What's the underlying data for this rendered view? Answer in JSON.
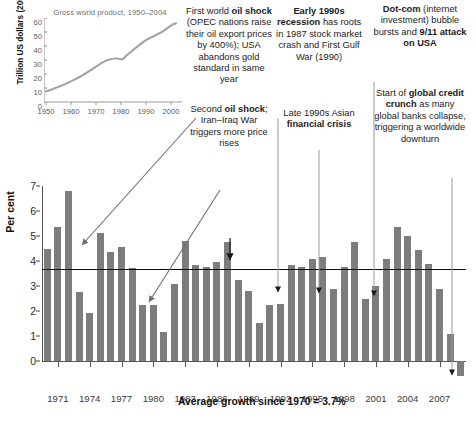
{
  "inset": {
    "title": "Gross world product, 1950–2004",
    "ylabel": "Trillion US dollars (2004 dollars)",
    "yticks": [
      "0",
      "10",
      "20",
      "30",
      "40",
      "50",
      "60"
    ],
    "xticks": [
      "1950",
      "1960",
      "1970",
      "1980",
      "1990",
      "2000"
    ]
  },
  "annotations": {
    "oil_shock_1": {
      "lines": [
        {
          "text": "First world ",
          "bold": false
        },
        {
          "text": "oil",
          "bold": true
        },
        {
          "text": " ",
          "bold": false
        },
        {
          "text": "shock",
          "bold": true
        },
        {
          "text": " (OPEC nations raise their oil export prices by 400%); USA abandons gold standard in same year",
          "bold": false
        }
      ],
      "plain": "First world oil shock (OPEC nations raise their oil export prices by 400%); USA abandons gold standard in same year"
    },
    "oil_shock_2": {
      "plain": "Second oil shock; Iran–Iraq War triggers more price rises"
    },
    "recession_1990s": {
      "plain": "Early 1990s recession has roots in 1987 stock market crash and First Gulf War (1990)"
    },
    "asian_crisis": {
      "plain": "Late 1990s Asian financial crisis"
    },
    "dotcom": {
      "plain": "Dot-com (internet investment) bubble bursts and 9/11 attack on USA"
    },
    "credit_crunch": {
      "plain": "Start of global credit crunch as many global banks collapse, triggering a worldwide downturn"
    }
  },
  "average_label": "Average growth since 1970 = 3.7%",
  "chart_data": {
    "type": "bar",
    "title": "",
    "xlabel": "",
    "ylabel": "Per cent",
    "ylim": [
      -1,
      7
    ],
    "yticks": [
      0,
      1,
      2,
      3,
      4,
      5,
      6,
      7
    ],
    "grid": false,
    "legend": "none",
    "average_line": 3.7,
    "categories": [
      1970,
      1971,
      1972,
      1973,
      1974,
      1975,
      1976,
      1977,
      1978,
      1979,
      1980,
      1981,
      1982,
      1983,
      1984,
      1985,
      1986,
      1987,
      1988,
      1989,
      1990,
      1991,
      1992,
      1993,
      1994,
      1995,
      1996,
      1997,
      1998,
      1999,
      2000,
      2001,
      2002,
      2003,
      2004,
      2005,
      2006,
      2007,
      2008,
      2009
    ],
    "xtick_labels": [
      "1971",
      "1974",
      "1977",
      "1980",
      "1983",
      "1986",
      "1989",
      "1992",
      "1995",
      "1998",
      "2001",
      "2004",
      "2007"
    ],
    "values": [
      4.47,
      5.37,
      6.82,
      2.75,
      1.91,
      5.11,
      4.36,
      4.57,
      3.73,
      2.24,
      2.24,
      1.18,
      3.07,
      4.8,
      3.85,
      3.77,
      3.95,
      4.77,
      3.26,
      2.8,
      1.52,
      2.25,
      2.28,
      3.83,
      3.77,
      4.1,
      4.15,
      2.9,
      3.75,
      4.78,
      2.5,
      3.0,
      4.1,
      5.35,
      5.0,
      4.45,
      3.9,
      2.9,
      1.1,
      -0.6
    ],
    "units": "percent",
    "note": "Annual world GDP growth; final bar (2009) is negative"
  },
  "inset_chart_data": {
    "type": "line",
    "title": "Gross world product, 1950–2004",
    "xlabel": "",
    "ylabel": "Trillion US dollars (2004 dollars)",
    "xlim": [
      1950,
      2004
    ],
    "ylim": [
      0,
      62
    ],
    "x": [
      1950,
      1955,
      1960,
      1965,
      1970,
      1975,
      1980,
      1985,
      1990,
      1995,
      2000,
      2004
    ],
    "values": [
      7.5,
      9.5,
      12.5,
      16.0,
      21.0,
      25.5,
      30.5,
      34.5,
      40.5,
      45.0,
      52.0,
      56.5
    ]
  }
}
